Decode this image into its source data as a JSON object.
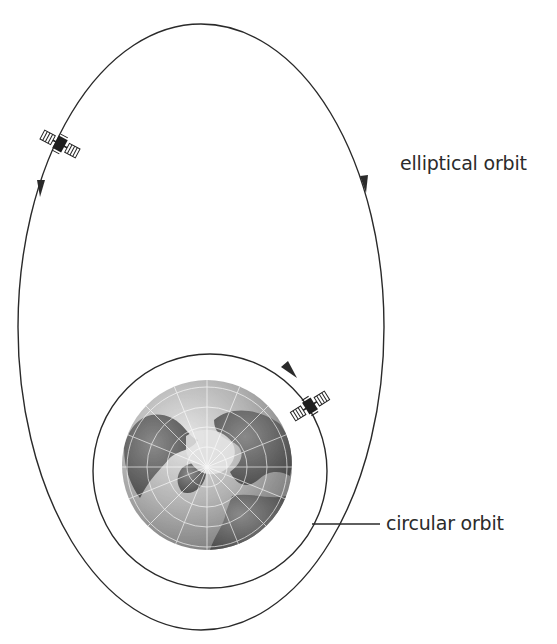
{
  "figure": {
    "type": "orbit-diagram",
    "labels": {
      "elliptical": "elliptical orbit",
      "circular": "circular orbit"
    },
    "elements": {
      "earth": "globe viewed from above the North Pole with latitude/longitude grid",
      "satellites": 2,
      "orbits": [
        "elliptical",
        "circular"
      ]
    },
    "colors": {
      "line": "#2a2a2a",
      "text": "#2b2b2b",
      "earth_ocean": "#b9b9b9",
      "earth_land": "#5f5f5f",
      "earth_ice": "#e2e2e2",
      "background": "#ffffff"
    }
  }
}
